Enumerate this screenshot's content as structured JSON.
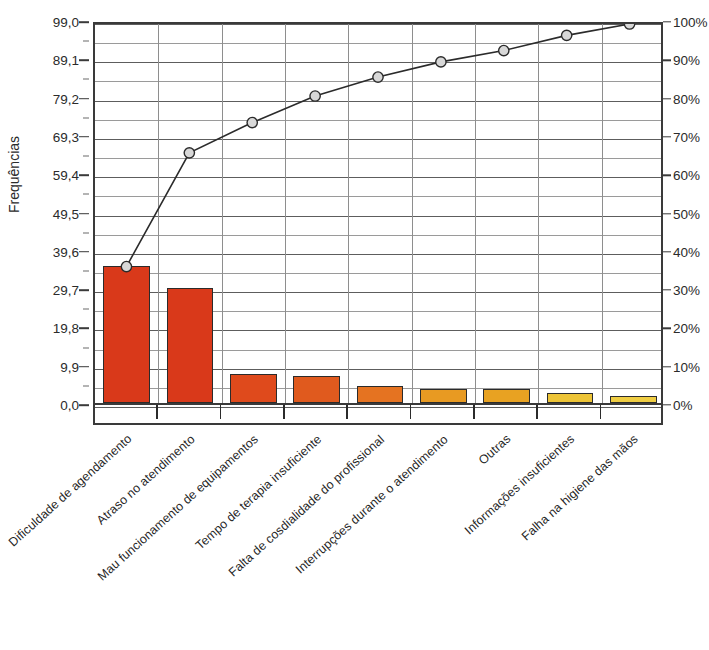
{
  "chart_data": {
    "type": "bar",
    "title": "",
    "subtitle": "",
    "xlabel": "",
    "ylabel": "Frequências",
    "y2label": "",
    "grid": true,
    "legend": "none",
    "categories": [
      "Dificuldade de agendamento",
      "Atraso no atendimento",
      "Mau funcionamento de equipamentos",
      "Tempo de terapia insuficiente",
      "Falta de cosdialidade do profissional",
      "Interrupções durante o atendimento",
      "Outras",
      "Informações insuficientes",
      "Falha na higiene das mãos"
    ],
    "series": [
      {
        "name": "Frequências",
        "type": "bar",
        "values": [
          35.3,
          29.8,
          7.5,
          7.0,
          4.5,
          3.5,
          3.5,
          2.7,
          1.8
        ]
      },
      {
        "name": "Percentual acumulado",
        "type": "line",
        "axis": "right",
        "values": [
          36,
          66,
          74,
          81,
          86,
          90,
          93,
          97,
          100
        ]
      }
    ],
    "ylim": [
      0,
      99.0
    ],
    "ylim_right": [
      0,
      100
    ],
    "yticks": [
      "0,0",
      "9,9",
      "19,8",
      "29,7",
      "39,6",
      "49,5",
      "59,4",
      "69,3",
      "79,2",
      "89,1",
      "99,0"
    ],
    "ytick_values": [
      0.0,
      9.9,
      19.8,
      29.7,
      39.6,
      49.5,
      59.4,
      69.3,
      79.2,
      89.1,
      99.0
    ],
    "yticks_right": [
      "0%",
      "10%",
      "20%",
      "30%",
      "40%",
      "50%",
      "60%",
      "70%",
      "80%",
      "90%",
      "100%"
    ],
    "ytick_right_values": [
      0,
      10,
      20,
      30,
      40,
      50,
      60,
      70,
      80,
      90,
      100
    ],
    "bar_colors": [
      "#D9391A",
      "#D9391A",
      "#DF4A1C",
      "#E05A1E",
      "#E57321",
      "#E89A22",
      "#E8A222",
      "#EDC437",
      "#EFCD43"
    ],
    "bar_border_color": "#2B2B2B",
    "line_color": "#2B2B2B",
    "marker_fill": "#D8D8D8",
    "marker_edge": "#2B2B2B",
    "grid_color": "#9A9A9A",
    "axis_color": "#3A3A3A"
  }
}
